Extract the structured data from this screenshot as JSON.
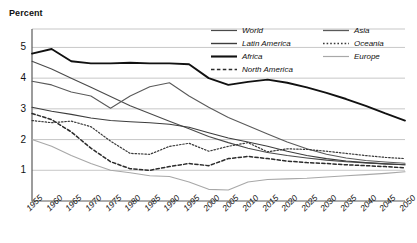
{
  "chart_data": {
    "type": "line",
    "title": "Percent",
    "xlabel": "",
    "ylabel": "Percent",
    "ylim": [
      0,
      5.6
    ],
    "yticks": [
      1,
      2,
      3,
      4,
      5
    ],
    "grid": true,
    "legend_position": "top-right-inside",
    "x": [
      1955,
      1960,
      1965,
      1970,
      1975,
      1980,
      1985,
      1990,
      1995,
      2000,
      2005,
      2010,
      2015,
      2020,
      2025,
      2030,
      2035,
      2040,
      2045,
      2050
    ],
    "categories": [
      "1955",
      "1960",
      "1965",
      "1970",
      "1975",
      "1980",
      "1985",
      "1990",
      "1995",
      "2000",
      "2005",
      "2010",
      "2015",
      "2020",
      "2025",
      "2030",
      "2035",
      "2040",
      "2045",
      "2050"
    ],
    "series": [
      {
        "name": "World",
        "style": "solid",
        "color": "#4a4a4a",
        "width": 1.1,
        "values": [
          4.55,
          4.3,
          4.0,
          3.7,
          3.4,
          3.1,
          2.85,
          2.6,
          2.35,
          2.1,
          1.9,
          1.72,
          1.58,
          1.48,
          1.4,
          1.33,
          1.28,
          1.24,
          1.21,
          1.18
        ]
      },
      {
        "name": "Latin America",
        "style": "solid",
        "color": "#3d3d3d",
        "width": 1.1,
        "values": [
          3.05,
          2.92,
          2.82,
          2.7,
          2.62,
          2.58,
          2.55,
          2.5,
          2.4,
          2.22,
          2.05,
          1.92,
          1.78,
          1.62,
          1.48,
          1.38,
          1.3,
          1.25,
          1.21,
          1.18
        ]
      },
      {
        "name": "Africa",
        "style": "solid",
        "color": "#111111",
        "width": 1.9,
        "values": [
          4.8,
          4.95,
          4.55,
          4.48,
          4.48,
          4.5,
          4.48,
          4.48,
          4.45,
          4.0,
          3.78,
          3.88,
          3.95,
          3.85,
          3.7,
          3.52,
          3.32,
          3.1,
          2.85,
          2.62
        ]
      },
      {
        "name": "North America",
        "style": "dashed",
        "color": "#2b2b2b",
        "width": 1.5,
        "values": [
          2.85,
          2.65,
          2.25,
          1.72,
          1.28,
          1.05,
          1.0,
          1.12,
          1.22,
          1.15,
          1.38,
          1.45,
          1.38,
          1.3,
          1.25,
          1.22,
          1.18,
          1.15,
          1.12,
          1.08
        ]
      },
      {
        "name": "Asia",
        "style": "solid",
        "color": "#5a5a5a",
        "width": 1.1,
        "values": [
          3.9,
          3.78,
          3.55,
          3.42,
          3.02,
          3.42,
          3.72,
          3.85,
          3.42,
          3.05,
          2.72,
          2.45,
          2.18,
          1.92,
          1.7,
          1.52,
          1.4,
          1.32,
          1.27,
          1.23
        ]
      },
      {
        "name": "Oceania",
        "style": "dotted",
        "color": "#3a3a3a",
        "width": 1.2,
        "values": [
          2.62,
          2.55,
          2.6,
          2.42,
          1.95,
          1.55,
          1.52,
          1.78,
          1.88,
          1.62,
          1.78,
          1.9,
          1.6,
          1.7,
          1.68,
          1.62,
          1.55,
          1.48,
          1.42,
          1.38
        ]
      },
      {
        "name": "Europe",
        "style": "solid",
        "color": "#a8a8a8",
        "width": 1.1,
        "values": [
          2.0,
          1.78,
          1.48,
          1.22,
          1.0,
          0.92,
          0.82,
          0.8,
          0.62,
          0.38,
          0.36,
          0.62,
          0.7,
          0.72,
          0.74,
          0.78,
          0.82,
          0.86,
          0.9,
          0.95
        ]
      }
    ]
  },
  "legend": {
    "left_column": [
      {
        "label": "World",
        "style": "solid",
        "color": "#4a4a4a",
        "width": 1.2
      },
      {
        "label": "Latin America",
        "style": "solid",
        "color": "#3d3d3d",
        "width": 1.4
      },
      {
        "label": "Africa",
        "style": "solid",
        "color": "#111111",
        "width": 2.1
      },
      {
        "label": "North America",
        "style": "dashed",
        "color": "#2b2b2b",
        "width": 1.6
      }
    ],
    "right_column": [
      {
        "label": "Asia",
        "style": "solid",
        "color": "#5a5a5a",
        "width": 1.3
      },
      {
        "label": "Oceania",
        "style": "dotted",
        "color": "#3a3a3a",
        "width": 1.3
      },
      {
        "label": "Europe",
        "style": "solid",
        "color": "#a8a8a8",
        "width": 1.2
      }
    ]
  },
  "colors": {
    "axis": "#5a5a5a",
    "grid": "#b9b9b9",
    "text": "#111111",
    "background": "#ffffff"
  }
}
